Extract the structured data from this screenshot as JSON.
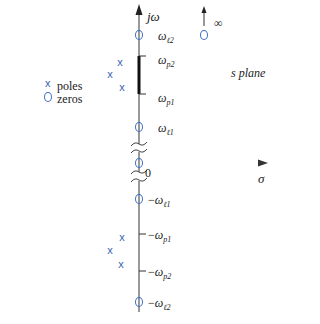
{
  "diagram": {
    "plane_label": "s plane",
    "axes": {
      "vertical_label": "jω",
      "horizontal_label": "σ",
      "origin_label": "0"
    },
    "legend": {
      "poles_label": "poles",
      "zeros_label": "zeros"
    },
    "infinity_label": "∞",
    "frequency_labels": {
      "wl2_pos": {
        "base": "ω",
        "sub": "ℓ2",
        "prefix": ""
      },
      "wp2_pos": {
        "base": "ω",
        "sub": "p2",
        "prefix": ""
      },
      "wp1_pos": {
        "base": "ω",
        "sub": "p1",
        "prefix": ""
      },
      "wl1_pos": {
        "base": "ω",
        "sub": "ℓ1",
        "prefix": ""
      },
      "wl1_neg": {
        "base": "ω",
        "sub": "ℓ1",
        "prefix": "−"
      },
      "wp1_neg": {
        "base": "ω",
        "sub": "p1",
        "prefix": "−"
      },
      "wp2_neg": {
        "base": "ω",
        "sub": "p2",
        "prefix": "−"
      },
      "wl2_neg": {
        "base": "ω",
        "sub": "ℓ2",
        "prefix": "−"
      }
    },
    "poles": [
      {
        "x": 120,
        "y": 62
      },
      {
        "x": 110,
        "y": 74
      },
      {
        "x": 122,
        "y": 87
      },
      {
        "x": 122,
        "y": 237
      },
      {
        "x": 110,
        "y": 250
      },
      {
        "x": 121,
        "y": 264
      }
    ],
    "zeros": [
      {
        "x": 139,
        "y": 35,
        "name": "zero-wl2-pos"
      },
      {
        "x": 139,
        "y": 127,
        "name": "zero-wl1-pos"
      },
      {
        "x": 139,
        "y": 163,
        "name": "zero-origin"
      },
      {
        "x": 139,
        "y": 199,
        "name": "zero-wl1-neg"
      },
      {
        "x": 139,
        "y": 302,
        "name": "zero-wl2-neg"
      },
      {
        "x": 204,
        "y": 35,
        "name": "zero-infinity"
      }
    ],
    "colors": {
      "axis": "#444444",
      "pole": "#3a62b0",
      "zero": "#3a6fc4",
      "passband": "#111111",
      "text": "#222222"
    }
  }
}
